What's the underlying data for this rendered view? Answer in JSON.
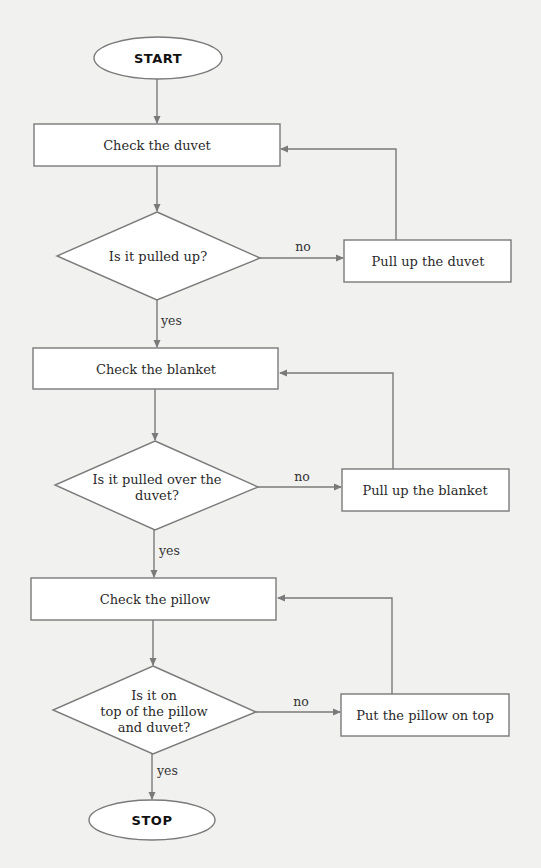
{
  "diagram": {
    "type": "flowchart",
    "colors": {
      "background": "#f1f1f0",
      "stroke": "#7a7a7a",
      "fill": "#ffffff",
      "text": "#2a2a2a"
    },
    "start": {
      "label": "START"
    },
    "stop": {
      "label": "STOP"
    },
    "sections": [
      {
        "process": "Check the duvet",
        "decision": [
          "Is it pulled up?"
        ],
        "no_label": "no",
        "action": "Pull up the duvet",
        "yes_label": "yes"
      },
      {
        "process": "Check the blanket",
        "decision": [
          "Is it pulled over the",
          "duvet?"
        ],
        "no_label": "no",
        "action": "Pull up the blanket",
        "yes_label": "yes"
      },
      {
        "process": "Check the pillow",
        "decision": [
          "Is it on",
          "top of the pillow",
          "and duvet?"
        ],
        "no_label": "no",
        "action": "Put the pillow on top",
        "yes_label": "yes"
      }
    ]
  }
}
